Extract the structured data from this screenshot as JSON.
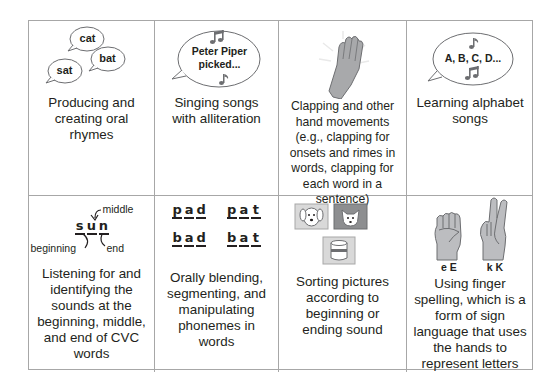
{
  "cells": [
    {
      "caption": "Producing and creating oral rhymes",
      "illustration": {
        "type": "speech-bubbles",
        "words": [
          "cat",
          "bat",
          "sat"
        ]
      }
    },
    {
      "caption": "Singing songs with alliteration",
      "illustration": {
        "type": "song-bubble",
        "text_line1": "Peter Piper",
        "text_line2": "picked..."
      }
    },
    {
      "caption": "Clapping and other hand movements (e.g., clapping for onsets and rimes in words, clapping for each word in a sentence)",
      "illustration": {
        "type": "clapping-hand"
      }
    },
    {
      "caption": "Learning alphabet songs",
      "illustration": {
        "type": "song-bubble",
        "text": "A, B, C, D..."
      }
    },
    {
      "caption": "Listening for and identifying the sounds at the beginning, middle, and end of CVC words",
      "illustration": {
        "type": "cvc-diagram",
        "letters": [
          "s",
          "u",
          "n"
        ],
        "labels": {
          "middle": "middle",
          "beginning": "beginning",
          "end": "end"
        }
      }
    },
    {
      "caption": "Orally blending, segmenting, and manipulating phonemes in words",
      "illustration": {
        "type": "phoneme-words",
        "words": [
          [
            "p",
            "a",
            "d"
          ],
          [
            "p",
            "a",
            "t"
          ],
          [
            "b",
            "a",
            "d"
          ],
          [
            "b",
            "a",
            "t"
          ]
        ]
      }
    },
    {
      "caption": "Sorting pictures according to beginning or ending sound",
      "illustration": {
        "type": "picture-cards",
        "pictures": [
          "dog",
          "cat",
          "can"
        ]
      }
    },
    {
      "caption": "Using finger spelling, which is a form of sign language that uses the hands to represent letters",
      "illustration": {
        "type": "sign-hands",
        "labels": [
          "e E",
          "k K"
        ]
      }
    }
  ]
}
